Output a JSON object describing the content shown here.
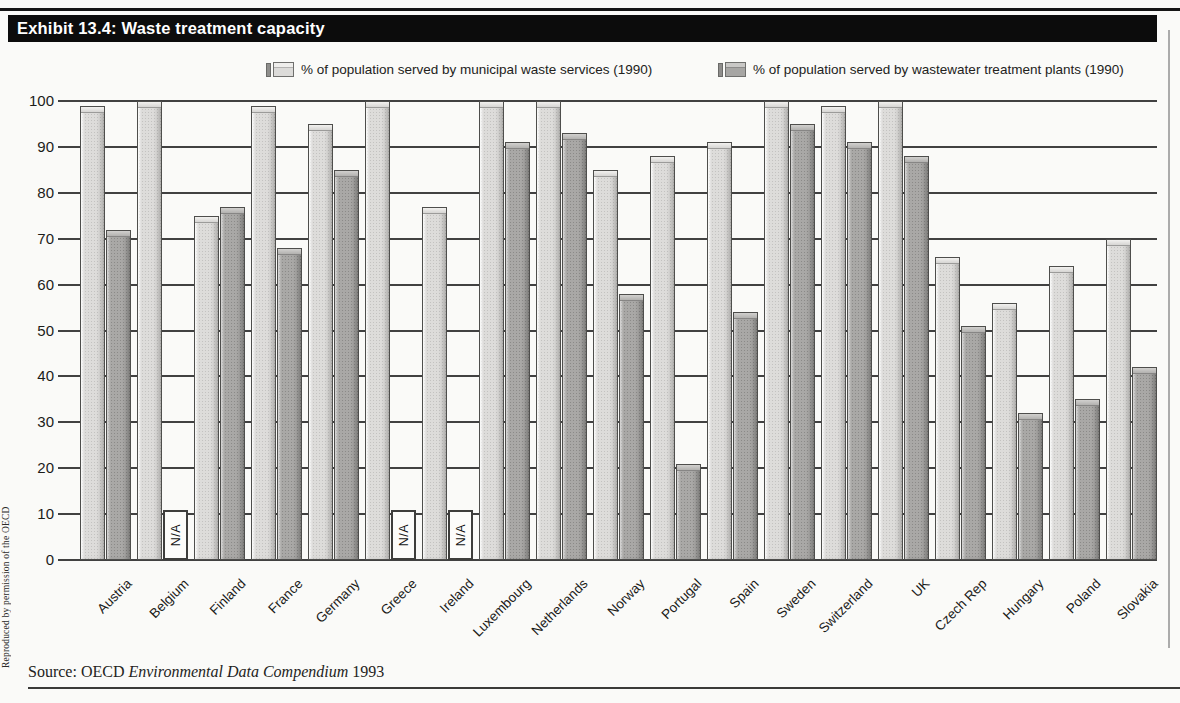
{
  "header": {
    "title": "Exhibit 13.4: Waste treatment capacity"
  },
  "page": {
    "side_note": "Reproduced by permission of the OECD",
    "na_label": "N/A"
  },
  "source": {
    "prefix": "Source: OECD ",
    "italic": "Environmental Data Compendium",
    "suffix": " 1993"
  },
  "chart_data": {
    "type": "bar",
    "title": "Exhibit 13.4: Waste treatment capacity",
    "categories": [
      "Austria",
      "Belgium",
      "Finland",
      "France",
      "Germany",
      "Greece",
      "Ireland",
      "Luxembourg",
      "Netherlands",
      "Norway",
      "Portugal",
      "Spain",
      "Sweden",
      "Switzerland",
      "UK",
      "Czech Rep",
      "Hungary",
      "Poland",
      "Slovakia"
    ],
    "series": [
      {
        "name": "% of population served by municipal waste services (1990)",
        "color_hex": "#dddcda",
        "values": [
          99,
          100,
          75,
          99,
          95,
          100,
          77,
          100,
          100,
          85,
          88,
          91,
          100,
          99,
          100,
          66,
          56,
          64,
          70
        ]
      },
      {
        "name": "% of population served by wastewater treatment plants (1990)",
        "color_hex": "#a9a8a6",
        "values": [
          72,
          null,
          77,
          68,
          85,
          null,
          null,
          91,
          93,
          58,
          21,
          54,
          95,
          91,
          88,
          51,
          32,
          35,
          42
        ]
      }
    ],
    "na_label": "N/A",
    "xlabel": "",
    "ylabel": "",
    "ylim": [
      0,
      100
    ],
    "yticks": [
      0,
      10,
      20,
      30,
      40,
      50,
      60,
      70,
      80,
      90,
      100
    ],
    "grid": true,
    "legend_position": "top"
  }
}
